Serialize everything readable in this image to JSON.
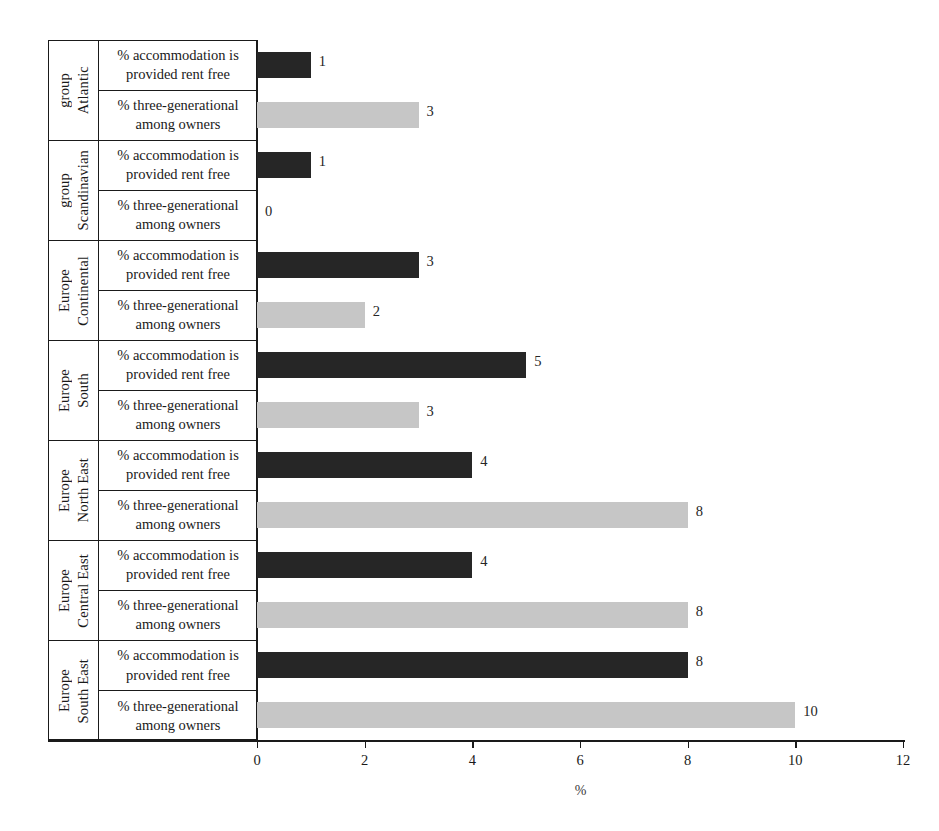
{
  "chart_data": {
    "type": "bar",
    "orientation": "horizontal",
    "title": "",
    "subtitle": "",
    "xlabel": "%",
    "ylabel": "",
    "xlim": [
      0,
      12
    ],
    "xticks": [
      0,
      2,
      4,
      6,
      8,
      10,
      12
    ],
    "xtick_labels": [
      "0",
      "2",
      "4",
      "6",
      "8",
      "10",
      "12"
    ],
    "grid": false,
    "legend": "none",
    "series_names": [
      "% accommodation is provided rent free",
      "% three-generational among owners"
    ],
    "series_colors": [
      "#262626",
      "#c6c6c6"
    ],
    "categories": [
      "Atlantic group",
      "Scandinavian group",
      "Continental Europe",
      "South Europe",
      "North East Europe",
      "Central East Europe",
      "South East Europe"
    ],
    "series": [
      {
        "name": "% accommodation is provided rent free",
        "color": "#262626",
        "values": [
          1,
          1,
          3,
          5,
          4,
          4,
          8
        ]
      },
      {
        "name": "% three-generational among owners",
        "color": "#c6c6c6",
        "values": [
          3,
          0,
          2,
          3,
          8,
          8,
          10
        ]
      }
    ],
    "groups": [
      {
        "label_lines": [
          "Atlantic",
          "group"
        ],
        "rows": [
          {
            "label_lines": [
              "% accommodation is",
              "provided rent free"
            ],
            "value": 1,
            "style": "dark"
          },
          {
            "label_lines": [
              "% three-generational",
              "among owners"
            ],
            "value": 3,
            "style": "light"
          }
        ]
      },
      {
        "label_lines": [
          "Scandinavian",
          "group"
        ],
        "rows": [
          {
            "label_lines": [
              "% accommodation is",
              "provided rent free"
            ],
            "value": 1,
            "style": "dark"
          },
          {
            "label_lines": [
              "% three-generational",
              "among owners"
            ],
            "value": 0,
            "style": "light"
          }
        ]
      },
      {
        "label_lines": [
          "Continental",
          "Europe"
        ],
        "rows": [
          {
            "label_lines": [
              "% accommodation is",
              "provided rent free"
            ],
            "value": 3,
            "style": "dark"
          },
          {
            "label_lines": [
              "% three-generational",
              "among owners"
            ],
            "value": 2,
            "style": "light"
          }
        ]
      },
      {
        "label_lines": [
          "South",
          "Europe"
        ],
        "rows": [
          {
            "label_lines": [
              "% accommodation is",
              "provided rent free"
            ],
            "value": 5,
            "style": "dark"
          },
          {
            "label_lines": [
              "% three-generational",
              "among owners"
            ],
            "value": 3,
            "style": "light"
          }
        ]
      },
      {
        "label_lines": [
          "North East",
          "Europe"
        ],
        "rows": [
          {
            "label_lines": [
              "% accommodation is",
              "provided rent free"
            ],
            "value": 4,
            "style": "dark"
          },
          {
            "label_lines": [
              "% three-generational",
              "among owners"
            ],
            "value": 8,
            "style": "light"
          }
        ]
      },
      {
        "label_lines": [
          "Central East",
          "Europe"
        ],
        "rows": [
          {
            "label_lines": [
              "% accommodation is",
              "provided rent free"
            ],
            "value": 4,
            "style": "dark"
          },
          {
            "label_lines": [
              "% three-generational",
              "among owners"
            ],
            "value": 8,
            "style": "light"
          }
        ]
      },
      {
        "label_lines": [
          "South East",
          "Europe"
        ],
        "rows": [
          {
            "label_lines": [
              "% accommodation is",
              "provided rent free"
            ],
            "value": 8,
            "style": "dark"
          },
          {
            "label_lines": [
              "% three-generational",
              "among owners"
            ],
            "value": 10,
            "style": "light"
          }
        ]
      }
    ]
  },
  "colors": {
    "dark_bar": "#262626",
    "light_bar": "#c6c6c6",
    "axis": "#1a1a1a",
    "background": "#ffffff"
  }
}
